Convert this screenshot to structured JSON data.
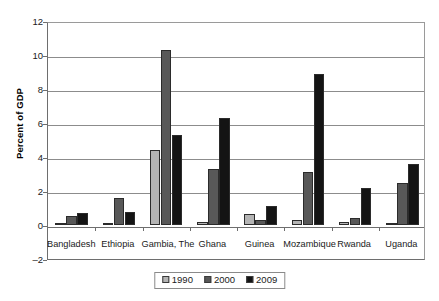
{
  "chart_data": {
    "type": "bar",
    "title": "",
    "xlabel": "",
    "ylabel": "Percent of GDP",
    "ylim": [
      -2,
      12
    ],
    "ytick_values": [
      12,
      10,
      8,
      6,
      4,
      2,
      0,
      -2
    ],
    "ytick_labels": [
      "12",
      "10",
      "8",
      "6",
      "4",
      "2",
      "0",
      "–2"
    ],
    "grid": true,
    "legend_position": "bottom",
    "categories": [
      "Bangladesh",
      "Ethiopia",
      "Gambia, The",
      "Ghana",
      "Guinea",
      "Mozambique",
      "Rwanda",
      "Uganda"
    ],
    "series": [
      {
        "name": "1990",
        "color": "#b4b4b4",
        "values": [
          0.0,
          0.05,
          4.4,
          0.2,
          0.65,
          0.3,
          0.15,
          0.02
        ]
      },
      {
        "name": "2000",
        "color": "#585858",
        "values": [
          0.55,
          1.6,
          10.3,
          3.3,
          0.3,
          3.1,
          0.4,
          2.5
        ]
      },
      {
        "name": "2009",
        "color": "#141414",
        "values": [
          0.72,
          0.75,
          5.3,
          6.3,
          1.1,
          8.9,
          2.15,
          3.6
        ]
      }
    ]
  },
  "legend": {
    "items": [
      {
        "label": "1990",
        "color": "#b4b4b4"
      },
      {
        "label": "2000",
        "color": "#585858"
      },
      {
        "label": "2009",
        "color": "#141414"
      }
    ]
  }
}
